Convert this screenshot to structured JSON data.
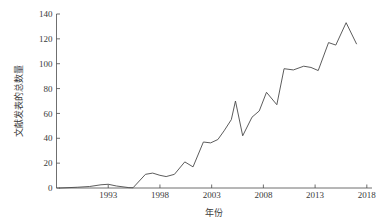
{
  "chart_data": {
    "type": "line",
    "title": "",
    "xlabel": "年份",
    "ylabel": "文献发表的总数量",
    "xlim": [
      1988,
      2018.5
    ],
    "ylim": [
      0,
      140
    ],
    "grid": false,
    "legend": null,
    "xticks": [
      "1993",
      "1998",
      "2003",
      "2008",
      "2013",
      "2018"
    ],
    "xtick_values": [
      1993,
      1998,
      2003,
      2008,
      2013,
      2018
    ],
    "yticks": [
      "0",
      "20",
      "40",
      "60",
      "80",
      "100",
      "120",
      "140"
    ],
    "ytick_values": [
      0,
      20,
      40,
      60,
      80,
      100,
      120,
      140
    ],
    "series": [
      {
        "name": "文献发表的总数量",
        "color": "#4a4a4a",
        "x": [
          1988,
          1989,
          1990,
          1991,
          1992,
          1993,
          1994,
          1995,
          1996,
          1997,
          1998,
          1999,
          2000,
          2001,
          2002,
          2003,
          2004,
          2005,
          2006,
          2007,
          2008,
          2009,
          2010,
          2011,
          2012,
          2013,
          2014,
          2015,
          2016,
          2017
        ],
        "values": [
          0,
          0,
          0,
          1,
          2,
          3,
          1,
          0,
          0,
          11,
          12,
          10,
          9,
          12,
          21,
          17,
          37,
          36,
          38,
          46,
          55,
          70,
          42,
          57,
          62,
          68,
          77,
          67,
          96,
          95
        ]
      }
    ],
    "points": [
      {
        "x": 1988,
        "y": 0
      },
      {
        "x": 1989,
        "y": 0
      },
      {
        "x": 1990,
        "y": 1
      },
      {
        "x": 1991,
        "y": 1
      },
      {
        "x": 1992,
        "y": 2
      },
      {
        "x": 1993,
        "y": 3
      },
      {
        "x": 1994,
        "y": 1
      },
      {
        "x": 1995,
        "y": 0
      },
      {
        "x": 1996,
        "y": 11
      },
      {
        "x": 1997,
        "y": 12
      },
      {
        "x": 1998,
        "y": 10
      },
      {
        "x": 1999,
        "y": 9
      },
      {
        "x": 2000,
        "y": 12
      },
      {
        "x": 2001,
        "y": 21
      },
      {
        "x": 2002,
        "y": 17
      },
      {
        "x": 2003,
        "y": 37
      },
      {
        "x": 2004,
        "y": 36
      },
      {
        "x": 2005,
        "y": 38
      },
      {
        "x": 2006,
        "y": 46
      },
      {
        "x": 2007,
        "y": 55
      },
      {
        "x": 2008,
        "y": 70
      },
      {
        "x": 2009,
        "y": 42
      },
      {
        "x": 2010,
        "y": 57
      },
      {
        "x": 2011,
        "y": 62
      },
      {
        "x": 2012,
        "y": 68
      },
      {
        "x": 2013,
        "y": 77
      },
      {
        "x": 2014,
        "y": 67
      },
      {
        "x": 2015,
        "y": 96
      },
      {
        "x": 2016,
        "y": 95
      },
      {
        "x": 2017,
        "y": 99
      },
      {
        "x": 2018,
        "y": 98
      }
    ],
    "line_vertices": [
      [
        1988.3,
        0
      ],
      [
        1990.0,
        0.6
      ],
      [
        1991.2,
        1.2
      ],
      [
        1992.3,
        2.6
      ],
      [
        1993.0,
        3.0
      ],
      [
        1993.8,
        1.6
      ],
      [
        1995.0,
        0.3
      ],
      [
        1995.4,
        0.2
      ],
      [
        1996.6,
        11.0
      ],
      [
        1997.3,
        12.0
      ],
      [
        1998.0,
        10.2
      ],
      [
        1998.6,
        9.2
      ],
      [
        1999.4,
        11.0
      ],
      [
        2000.4,
        21.0
      ],
      [
        2001.2,
        17.0
      ],
      [
        2002.2,
        37.0
      ],
      [
        2002.9,
        36.3
      ],
      [
        2003.6,
        39.0
      ],
      [
        2004.2,
        46.0
      ],
      [
        2004.9,
        55.0
      ],
      [
        2005.3,
        70.0
      ],
      [
        2006.0,
        42.0
      ],
      [
        2006.9,
        57.0
      ],
      [
        2007.6,
        62.0
      ],
      [
        2008.3,
        77.0
      ],
      [
        2009.3,
        67.0
      ],
      [
        2010.0,
        96.0
      ],
      [
        2010.9,
        95.0
      ],
      [
        2011.9,
        98.0
      ],
      [
        2012.6,
        97.0
      ],
      [
        2013.3,
        94.5
      ],
      [
        2014.3,
        117.0
      ],
      [
        2015.0,
        115.0
      ],
      [
        2016.0,
        133.0
      ],
      [
        2017.0,
        116.0
      ]
    ],
    "max_value": 133,
    "max_year": 2016,
    "final_value": 116,
    "final_year": 2017
  },
  "axes": {
    "y_axis_title": "文献发表的总数量",
    "x_axis_title": "年份"
  }
}
